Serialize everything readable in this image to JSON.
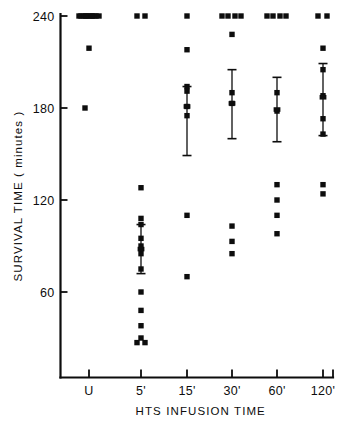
{
  "chart_data": {
    "type": "scatter",
    "title": "",
    "xlabel": "HTS  INFUSION  TIME",
    "ylabel": "SURVIVAL TIME  ( minutes )",
    "ylim": [
      25,
      245
    ],
    "yticks": [
      60,
      120,
      180,
      240
    ],
    "ytick_labels": [
      "60",
      "120",
      "180",
      "240"
    ],
    "categories": [
      "U",
      "5'",
      "15'",
      "30'",
      "60'",
      "120'"
    ],
    "xtick_labels": [
      "U",
      "5'",
      "15'",
      "30'",
      "60'",
      "120'"
    ],
    "grid": false,
    "legend": null,
    "marker_style": "filled-square",
    "note": "Individual animal survival times by HTS infusion duration; vertical bars show mean with standard error.",
    "groups": [
      {
        "name": "U",
        "x_index": 0,
        "values": [
          240,
          240,
          240,
          240,
          240,
          240,
          240,
          240,
          240,
          240,
          240,
          219,
          180
        ],
        "jitter": [
          -8,
          -3,
          2,
          7,
          -10,
          -5,
          0,
          5,
          10,
          -3,
          3,
          0,
          -4
        ],
        "censored_at_240": 11,
        "mean": null,
        "sem": null
      },
      {
        "name": "5'",
        "x_index": 1,
        "values": [
          240,
          240,
          128,
          108,
          104,
          95,
          90,
          85,
          75,
          60,
          48,
          38,
          30,
          27,
          27
        ],
        "jitter": [
          -4,
          4,
          0,
          0,
          0,
          0,
          0,
          0,
          0,
          0,
          0,
          0,
          0,
          -4,
          4
        ],
        "censored_at_240": 2,
        "mean": 88,
        "sem_low": 72,
        "sem_high": 104
      },
      {
        "name": "15'",
        "x_index": 2,
        "values": [
          240,
          218,
          194,
          191,
          181,
          175,
          110,
          70
        ],
        "jitter": [
          0,
          0,
          0,
          0,
          0,
          0,
          0,
          0
        ],
        "censored_at_240": 1,
        "mean": 181,
        "sem_low": 149,
        "sem_high": 194
      },
      {
        "name": "30'",
        "x_index": 3,
        "values": [
          240,
          240,
          240,
          240,
          228,
          190,
          183,
          103,
          93,
          85
        ],
        "jitter": [
          -10,
          -4,
          3,
          9,
          0,
          0,
          0,
          0,
          0,
          0
        ],
        "censored_at_240": 4,
        "mean": 183,
        "sem_low": 160,
        "sem_high": 205
      },
      {
        "name": "60'",
        "x_index": 4,
        "values": [
          240,
          240,
          240,
          240,
          190,
          178,
          130,
          120,
          110,
          98
        ],
        "jitter": [
          -10,
          -4,
          3,
          9,
          0,
          0,
          0,
          0,
          0,
          0
        ],
        "censored_at_240": 4,
        "mean": 179,
        "sem_low": 158,
        "sem_high": 200
      },
      {
        "name": "120'",
        "x_index": 5,
        "values": [
          240,
          240,
          219,
          205,
          188,
          173,
          163,
          130,
          124
        ],
        "jitter": [
          -5,
          4,
          0,
          0,
          0,
          0,
          0,
          0,
          0
        ],
        "censored_at_240": 2,
        "mean": 187,
        "sem_low": 162,
        "sem_high": 209
      }
    ]
  },
  "axes": {
    "y_axis_label": "SURVIVAL TIME  ( minutes )",
    "x_axis_label": "HTS  INFUSION  TIME"
  }
}
